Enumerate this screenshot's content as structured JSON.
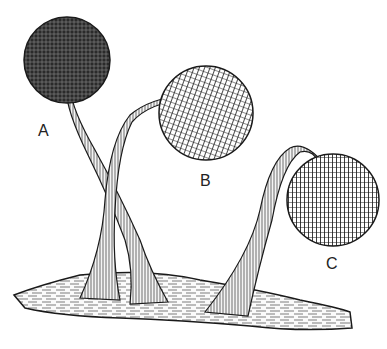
{
  "figure": {
    "labels": [
      {
        "id": "A",
        "text": "A",
        "x": 38,
        "y": 122
      },
      {
        "id": "B",
        "text": "B",
        "x": 200,
        "y": 172
      },
      {
        "id": "C",
        "text": "C",
        "x": 326,
        "y": 255
      }
    ],
    "colors": {
      "ink": "#1a1a1a",
      "paper": "#ffffff"
    }
  }
}
